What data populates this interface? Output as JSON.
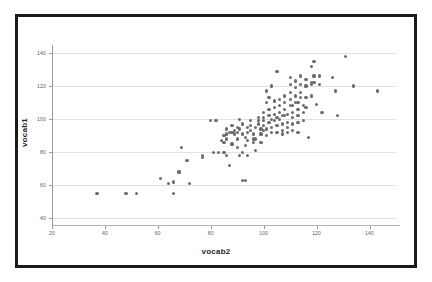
{
  "chart_data": {
    "type": "scatter",
    "title": "",
    "xlabel": "vocab2",
    "ylabel": "vocab1",
    "xlim": [
      20,
      150
    ],
    "ylim": [
      36,
      146
    ],
    "xticks": [
      20,
      40,
      60,
      80,
      100,
      120,
      140
    ],
    "yticks": [
      40,
      60,
      80,
      100,
      120,
      140
    ],
    "xtick_labels": [
      "20",
      "40",
      "60",
      "80",
      "100",
      "120",
      "140"
    ],
    "ytick_labels": [
      "40",
      "60",
      "80",
      "100",
      "120",
      "140"
    ],
    "grid": "horizontal",
    "legend": "none",
    "marker_color": "#6b6b73",
    "grid_color": "#e2e2e2",
    "axis_color": "#9a9a9a",
    "frame_color": "#1a1a1a",
    "background": "#ffffff",
    "points": [
      [
        37,
        55
      ],
      [
        48,
        55
      ],
      [
        52,
        55
      ],
      [
        66,
        55
      ],
      [
        64,
        61
      ],
      [
        66,
        62
      ],
      [
        72,
        61
      ],
      [
        61,
        64
      ],
      [
        68,
        68
      ],
      [
        69,
        83
      ],
      [
        71,
        75
      ],
      [
        77,
        77
      ],
      [
        77,
        78
      ],
      [
        80,
        99
      ],
      [
        82,
        99
      ],
      [
        81,
        80
      ],
      [
        83,
        80
      ],
      [
        85,
        80
      ],
      [
        86,
        78
      ],
      [
        87,
        72
      ],
      [
        84,
        87
      ],
      [
        85,
        86
      ],
      [
        86,
        88
      ],
      [
        85,
        90
      ],
      [
        87,
        92
      ],
      [
        88,
        92
      ],
      [
        86,
        94
      ],
      [
        88,
        96
      ],
      [
        89,
        91
      ],
      [
        90,
        88
      ],
      [
        90,
        92
      ],
      [
        91,
        94
      ],
      [
        91,
        100
      ],
      [
        92,
        97
      ],
      [
        92,
        91
      ],
      [
        93,
        89
      ],
      [
        93,
        84
      ],
      [
        91,
        78
      ],
      [
        92,
        63
      ],
      [
        93,
        63
      ],
      [
        94,
        92
      ],
      [
        94,
        95
      ],
      [
        95,
        99
      ],
      [
        95,
        96
      ],
      [
        95,
        93
      ],
      [
        96,
        91
      ],
      [
        96,
        88
      ],
      [
        96,
        86
      ],
      [
        97,
        81
      ],
      [
        97,
        95
      ],
      [
        98,
        99
      ],
      [
        98,
        101
      ],
      [
        98,
        97
      ],
      [
        99,
        94
      ],
      [
        99,
        91
      ],
      [
        100,
        101
      ],
      [
        100,
        104
      ],
      [
        100,
        99
      ],
      [
        100,
        96
      ],
      [
        100,
        93
      ],
      [
        101,
        90
      ],
      [
        101,
        110
      ],
      [
        101,
        117
      ],
      [
        102,
        113
      ],
      [
        102,
        106
      ],
      [
        102,
        102
      ],
      [
        102,
        98
      ],
      [
        103,
        95
      ],
      [
        103,
        92
      ],
      [
        103,
        120
      ],
      [
        104,
        111
      ],
      [
        104,
        107
      ],
      [
        104,
        103
      ],
      [
        104,
        99
      ],
      [
        105,
        96
      ],
      [
        105,
        92
      ],
      [
        105,
        129
      ],
      [
        106,
        112
      ],
      [
        106,
        108
      ],
      [
        106,
        104
      ],
      [
        106,
        100
      ],
      [
        107,
        97
      ],
      [
        107,
        93
      ],
      [
        107,
        91
      ],
      [
        108,
        114
      ],
      [
        108,
        110
      ],
      [
        108,
        106
      ],
      [
        108,
        102
      ],
      [
        109,
        98
      ],
      [
        109,
        95
      ],
      [
        109,
        92
      ],
      [
        110,
        125
      ],
      [
        110,
        121
      ],
      [
        110,
        116
      ],
      [
        110,
        112
      ],
      [
        110,
        108
      ],
      [
        111,
        104
      ],
      [
        111,
        101
      ],
      [
        111,
        97
      ],
      [
        111,
        93
      ],
      [
        112,
        123
      ],
      [
        112,
        119
      ],
      [
        112,
        114
      ],
      [
        112,
        110
      ],
      [
        113,
        106
      ],
      [
        113,
        102
      ],
      [
        113,
        98
      ],
      [
        113,
        92
      ],
      [
        114,
        126
      ],
      [
        114,
        121
      ],
      [
        114,
        116
      ],
      [
        114,
        113
      ],
      [
        115,
        108
      ],
      [
        115,
        104
      ],
      [
        115,
        99
      ],
      [
        116,
        124
      ],
      [
        116,
        120
      ],
      [
        116,
        113
      ],
      [
        116,
        107
      ],
      [
        117,
        89
      ],
      [
        118,
        132
      ],
      [
        118,
        122
      ],
      [
        118,
        121
      ],
      [
        118,
        114
      ],
      [
        119,
        135
      ],
      [
        119,
        126
      ],
      [
        119,
        122
      ],
      [
        120,
        109
      ],
      [
        121,
        126
      ],
      [
        121,
        121
      ],
      [
        122,
        104
      ],
      [
        126,
        125
      ],
      [
        127,
        117
      ],
      [
        128,
        102
      ],
      [
        131,
        138
      ],
      [
        134,
        120
      ],
      [
        143,
        117
      ],
      [
        89,
        93
      ],
      [
        90,
        95
      ],
      [
        94,
        87
      ],
      [
        97,
        88
      ],
      [
        99,
        86
      ],
      [
        101,
        94
      ],
      [
        103,
        100
      ],
      [
        105,
        101
      ],
      [
        107,
        102
      ],
      [
        109,
        103
      ],
      [
        111,
        108
      ],
      [
        113,
        110
      ],
      [
        86,
        91
      ],
      [
        88,
        85
      ],
      [
        90,
        83
      ],
      [
        92,
        80
      ],
      [
        94,
        78
      ]
    ]
  },
  "axis_titles": {
    "x": "vocab2",
    "y": "vocab1"
  }
}
